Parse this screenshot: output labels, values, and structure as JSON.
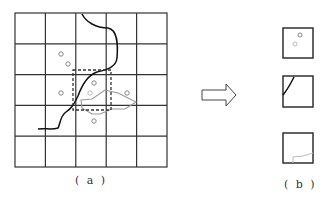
{
  "figure": {
    "panel_a": {
      "caption": "( a )",
      "grid": {
        "rows": 5,
        "cols": 5,
        "x0": 15,
        "y0": 13,
        "x1": 167,
        "y1": 167
      },
      "points": [
        {
          "x": 61,
          "y": 54
        },
        {
          "x": 68,
          "y": 64
        },
        {
          "x": 94,
          "y": 83
        },
        {
          "x": 61,
          "y": 93
        },
        {
          "x": 90,
          "y": 93,
          "light": true
        },
        {
          "x": 127,
          "y": 93
        },
        {
          "x": 94,
          "y": 121
        }
      ]
    },
    "arrow": {
      "direction": "right"
    },
    "panel_b": {
      "caption": "( b )",
      "cells": [
        {
          "name": "cell-with-points"
        },
        {
          "name": "cell-with-line"
        },
        {
          "name": "cell-with-polygon"
        }
      ]
    }
  },
  "colors": {
    "grid": "#333333",
    "line": "#111111",
    "polygon": "#999999",
    "point": "#888888"
  }
}
